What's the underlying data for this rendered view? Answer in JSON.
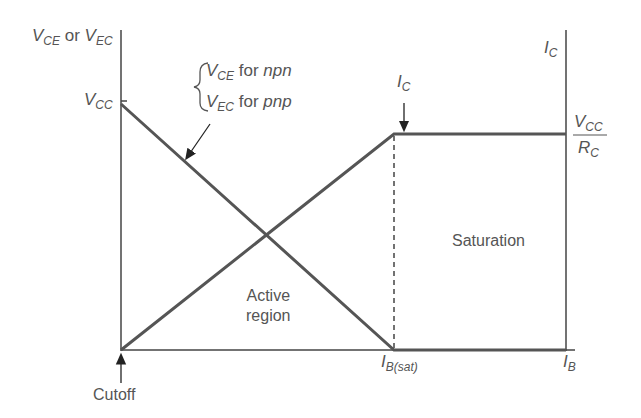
{
  "diagram": {
    "left_axis_label": {
      "main": "V",
      "sub": "CE",
      "or": "or",
      "main2": "V",
      "sub2": "EC"
    },
    "vcc_label": {
      "main": "V",
      "sub": "CC"
    },
    "curve_note": {
      "line1": {
        "main": "V",
        "sub": "CE",
        "text": "for",
        "type": "npn"
      },
      "line2": {
        "main": "V",
        "sub": "EC",
        "text": "for",
        "type": "pnp"
      }
    },
    "ic_arrow_label": {
      "main": "I",
      "sub": "C"
    },
    "right_axis_label": {
      "main": "I",
      "sub": "C"
    },
    "ic_max_label": {
      "num_main": "V",
      "num_sub": "CC",
      "den_main": "R",
      "den_sub": "C"
    },
    "regions": {
      "active_line1": "Active",
      "active_line2": "region",
      "saturation": "Saturation",
      "cutoff": "Cutoff"
    },
    "x_axis_label": {
      "main": "I",
      "sub": "B"
    },
    "ib_sat_label": {
      "main": "I",
      "sub": "B(sat)"
    },
    "colors": {
      "axis": "#444444",
      "curve": "#555555",
      "text": "#555555"
    }
  }
}
